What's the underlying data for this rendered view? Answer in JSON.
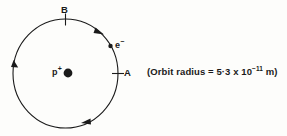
{
  "figure": {
    "kind": "bohr-atom-orbit-diagram",
    "background_color": "#fdfdfb",
    "ink_color": "#1a1a1a"
  },
  "orbit": {
    "center_x": 65.5,
    "center_y": 73.5,
    "radius_x": 52.5,
    "radius_y": 54.5,
    "stroke_width": 1.1,
    "direction": "clockwise",
    "arrow_count": 3
  },
  "labels": {
    "point_b": "B",
    "point_a": "A",
    "electron_symbol": "e",
    "electron_charge": "−",
    "proton_symbol": "p",
    "proton_charge": "+"
  },
  "annotation": {
    "prefix": "(Orbit radius = 5·3 x 10",
    "exponent": "−11",
    "suffix": " m)",
    "full_text": "(Orbit radius = 5·3 x 10⁻¹¹ m)",
    "quantity": "orbit radius",
    "value": 5.3,
    "exponent_value": -11,
    "unit": "m"
  },
  "markers": {
    "point_a_tick": "tick-mark-at-A",
    "point_b_tick": "tick-mark-at-B",
    "electron_dot_radius": 2.2,
    "proton_dot_radius": 4.4
  }
}
